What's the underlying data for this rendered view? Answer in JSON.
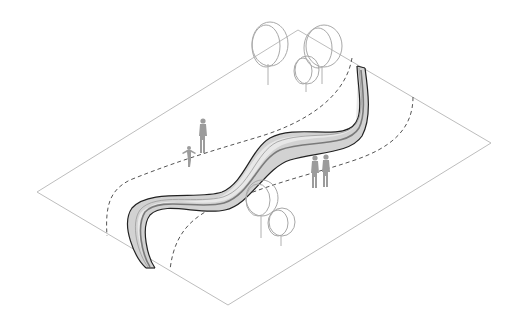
{
  "diagram": {
    "type": "axonometric landscape diagram",
    "colors": {
      "background": "#ffffff",
      "plane_outline": "#bdbdbd",
      "ribbon_fill": "#d2d2d2",
      "ribbon_edge": "#222222",
      "dashed_path": "#555555",
      "tree_outline": "#a8a8a8",
      "person_silhouette": "#9c9c9c"
    },
    "ground_plane": {
      "corners": [
        [
          298,
          30
        ],
        [
          491,
          143
        ],
        [
          228,
          305
        ],
        [
          37,
          192
        ]
      ]
    },
    "elements": {
      "ribbon": "serpentine ribbon bench",
      "dashed_paths": [
        "left path",
        "right path"
      ],
      "trees_top": 4,
      "trees_bottom": 2,
      "people": [
        "adult left",
        "child left",
        "adult right 1",
        "adult right 2"
      ]
    }
  }
}
